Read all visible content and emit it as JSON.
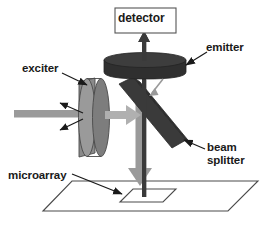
{
  "figure": {
    "background_color": "#ffffff"
  },
  "labels": {
    "detector": "detector",
    "emitter": "emitter",
    "exciter": "exciter",
    "beam_splitter_line1": "beam",
    "beam_splitter_line2": "splitter",
    "microarray": "microarray"
  },
  "colors": {
    "outline": "#1a1a1a",
    "text": "#1a1a1a",
    "dark_component": "#3a3a3a",
    "mid_gray_component": "#808080",
    "light_beam": "#9a9a9a",
    "emitted_beam": "#b0b0b0",
    "stage_line": "#4a4a4a",
    "background": "#ffffff"
  },
  "components": [
    {
      "name": "detector",
      "shape": "rectangle-box",
      "label": "detector",
      "fill": "#ffffff",
      "stroke": "#555555"
    },
    {
      "name": "emitter",
      "shape": "horizontal-disc-cylinder",
      "label": "emitter",
      "fill": "#3a3a3a"
    },
    {
      "name": "exciter",
      "shape": "vertical-disc-cylinder",
      "label": "exciter",
      "fill": "#808080"
    },
    {
      "name": "beam-splitter",
      "shape": "tilted-slab",
      "label": "beam splitter",
      "fill": "#3a3a3a",
      "tilt": "upper-left to lower-right"
    },
    {
      "name": "microarray",
      "shape": "parallelogram-stage-with-inner-slide",
      "label": "microarray",
      "fill": "#ffffff",
      "stroke": "#4a4a4a"
    }
  ],
  "beams": [
    {
      "name": "excitation-source-beam",
      "direction": "left-to-right",
      "color": "#9a9a9a",
      "description": "thick horizontal light beam entering the exciter from the left"
    },
    {
      "name": "excitation-beam-to-splitter",
      "direction": "left-to-right",
      "color": "#b0b0b0",
      "description": "arrow from exciter toward beam splitter"
    },
    {
      "name": "excitation-beam-to-microarray",
      "direction": "downward",
      "color": "#9a9a9a",
      "description": "thick arrow from beam splitter down onto the microarray"
    },
    {
      "name": "emission-beam-to-detector",
      "direction": "upward",
      "color": "#3a3a3a",
      "description": "dark vertical beam from microarray up through splitter and emitter into detector"
    },
    {
      "name": "stray-reflection-upper",
      "direction": "up-left",
      "color": "#3a3a3a",
      "description": "thin reflected ray leaving the exciter upward-left"
    },
    {
      "name": "stray-reflection-lower",
      "direction": "down-left",
      "color": "#3a3a3a",
      "description": "thin reflected ray leaving the exciter downward-left"
    },
    {
      "name": "emitter-stray-ray",
      "direction": "down-left",
      "color": "#9a9a9a",
      "description": "short gray ray below the emitter pointing down-left"
    }
  ],
  "leader_lines": [
    {
      "name": "emitter-leader",
      "from_label": "emitter",
      "points_to": "emitter"
    },
    {
      "name": "exciter-leader",
      "from_label": "exciter",
      "points_to": "exciter"
    },
    {
      "name": "beam-splitter-leader",
      "from_label": "beam splitter",
      "points_to": "beam-splitter"
    },
    {
      "name": "microarray-leader",
      "from_label": "microarray",
      "points_to": "microarray"
    }
  ]
}
